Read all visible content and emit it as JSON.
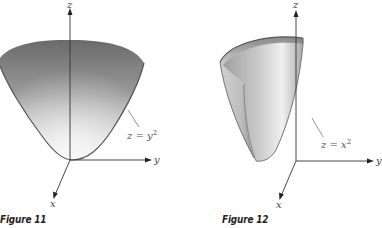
{
  "figures": [
    {
      "id": "figure-11",
      "caption": "Figure 11",
      "equation": {
        "lhs": "z = y",
        "exponent": "2"
      },
      "axes": {
        "x": "x",
        "y": "y",
        "z": "z"
      },
      "surface": "full paraboloid bowl z = y², shaded dark gray at rim to light gray at vertex"
    },
    {
      "id": "figure-12",
      "caption": "Figure 12",
      "equation": {
        "lhs": "z = x",
        "exponent": "2"
      },
      "axes": {
        "x": "x",
        "y": "y",
        "z": "z"
      },
      "surface": "cut-away parabolic cylinder z = x², light gray interior with darker rim"
    }
  ],
  "colors": {
    "background": "#ffffff",
    "axis": "#333333",
    "surface_dark": "#6e6e6e",
    "surface_light": "#f2f2f2",
    "rim": "#555555"
  }
}
